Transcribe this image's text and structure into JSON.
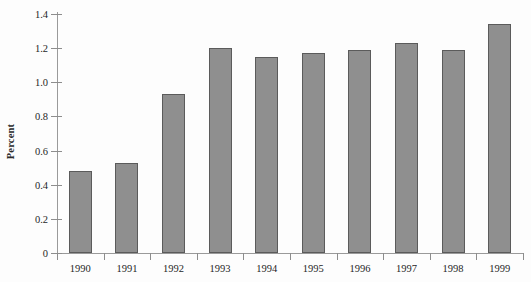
{
  "chart_data": {
    "type": "bar",
    "title": "",
    "xlabel": "",
    "ylabel": "Percent",
    "categories": [
      "1990",
      "1991",
      "1992",
      "1993",
      "1994",
      "1995",
      "1996",
      "1997",
      "1998",
      "1999"
    ],
    "values": [
      0.48,
      0.53,
      0.93,
      1.2,
      1.15,
      1.17,
      1.19,
      1.23,
      1.19,
      1.34
    ],
    "ylim": [
      0,
      1.4
    ],
    "ytick_labels": [
      "0",
      "0.2",
      "0.4",
      "0.6",
      "0.8",
      "1.0",
      "1.2",
      "1.4"
    ],
    "ytick_values": [
      0,
      0.2,
      0.4,
      0.6,
      0.8,
      1.0,
      1.2,
      1.4
    ],
    "grid": false,
    "legend": null,
    "bar_color": "#8f8f8f",
    "bar_edge_color": "#5b5b5b",
    "axis_color": "#8d8d8d",
    "background": "#fdfdfd"
  }
}
